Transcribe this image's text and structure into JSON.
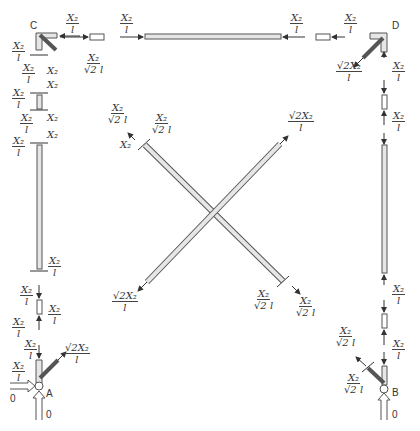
{
  "nodes": {
    "A": "A",
    "B": "B",
    "C": "C",
    "D": "D"
  },
  "reactions": {
    "A_horizontal": "0",
    "A_vertical": "0",
    "B_vertical": "0"
  },
  "labels": {
    "x_over_l": {
      "num": "X₂",
      "den": "l"
    },
    "x_over_sqrt2l": {
      "num": "X₂",
      "den": "√2 l"
    },
    "sqrt2x_over_l": {
      "num": "√2X₂",
      "den": "l"
    },
    "x": "X₂"
  },
  "colors": {
    "member_fill": "#e6e6e6",
    "member_stroke": "#555555",
    "arrow": "#333333",
    "text": "#333333"
  }
}
